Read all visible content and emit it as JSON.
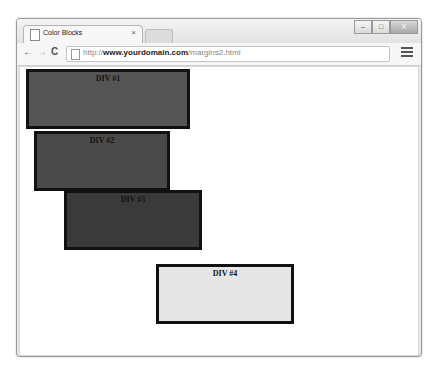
{
  "browser": {
    "tab": {
      "title": "Color Blocks",
      "close": "×",
      "icon": "page-icon"
    },
    "window_controls": {
      "minimize": "‒",
      "maximize": "□",
      "close": "X"
    },
    "toolbar": {
      "back": "←",
      "forward": "→",
      "reload": "C"
    },
    "address": {
      "scheme": "http://",
      "host": "www.yourdomain.com",
      "path": "/margins2.html"
    }
  },
  "page": {
    "blocks": [
      {
        "label": "DIV #1",
        "color": "#555555"
      },
      {
        "label": "DIV #2",
        "color": "#4a4a4a"
      },
      {
        "label": "DIV #3",
        "color": "#3a3a3a"
      },
      {
        "label": "DIV #4",
        "color": "#e6e6e6"
      }
    ]
  }
}
